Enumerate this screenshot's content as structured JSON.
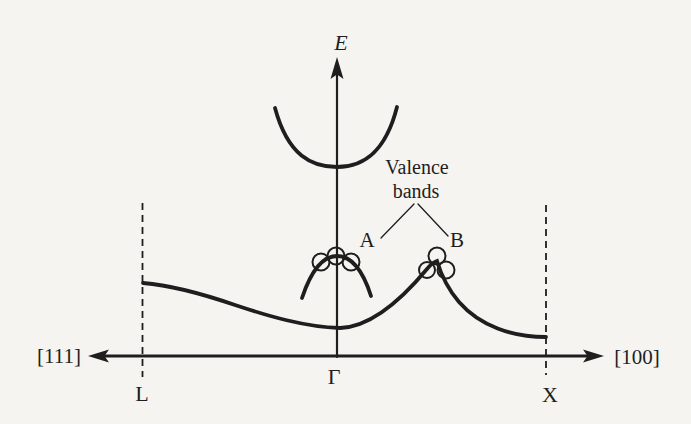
{
  "figure": {
    "type": "energy-band-diagram",
    "energy_axis_label": "E",
    "k_axis": {
      "left_label": "[111]",
      "right_label": "[100]"
    },
    "points": {
      "left": "L",
      "center": "Γ",
      "right": "X"
    },
    "annotations": {
      "valence_line1": "Valence",
      "valence_line2": "bands",
      "band_a": "A",
      "band_b": "B"
    },
    "hole_markers": {
      "band_a_count": 3,
      "band_b_count": 3
    },
    "colors": {
      "ink": "#1e1e1e",
      "paper": "#f5f4f1"
    }
  }
}
